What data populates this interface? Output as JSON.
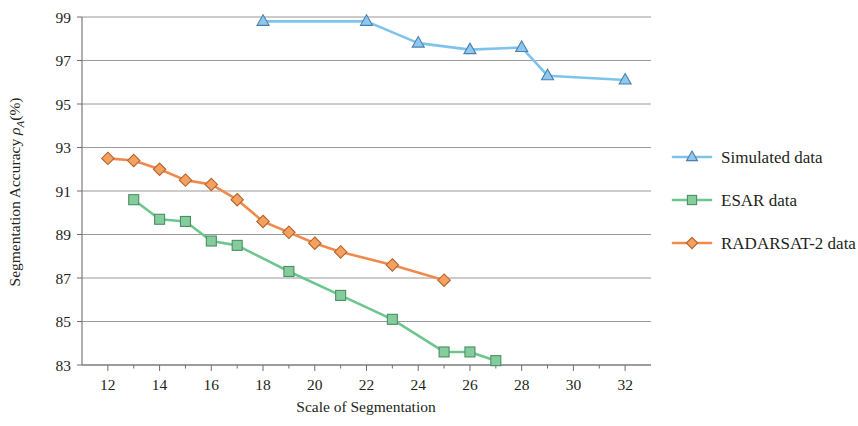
{
  "chart_data": {
    "type": "line",
    "title": "",
    "xlabel": "Scale of Segmentation",
    "ylabel": "Segmentation Accuracy ρA(%)",
    "ylabel_parts": {
      "prefix": "Segmentation Accuracy ",
      "symbol": "ρ",
      "subscript": "A",
      "suffix": "(%)"
    },
    "xlim": [
      11,
      33
    ],
    "ylim": [
      83,
      99
    ],
    "xticks": [
      12,
      14,
      16,
      18,
      20,
      22,
      24,
      26,
      28,
      30,
      32
    ],
    "xticks_minor": [
      13,
      15,
      17,
      19,
      21,
      23,
      25,
      27,
      29,
      31
    ],
    "yticks": [
      83,
      85,
      87,
      89,
      91,
      93,
      95,
      97,
      99
    ],
    "grid": "horizontal",
    "legend_position": "right",
    "series": [
      {
        "name": "Simulated data",
        "color": "#7EC3EC",
        "marker": "triangle",
        "marker_fill": "#8FC8EE",
        "marker_stroke": "#4a7fae",
        "x": [
          18,
          22,
          24,
          26,
          28,
          29,
          32
        ],
        "y": [
          98.8,
          98.8,
          97.8,
          97.5,
          97.6,
          96.3,
          96.1
        ]
      },
      {
        "name": "ESAR data",
        "color": "#6CC68E",
        "marker": "square",
        "marker_fill": "#84CC9B",
        "marker_stroke": "#4a8f63",
        "x": [
          13,
          14,
          15,
          16,
          17,
          19,
          21,
          23,
          25,
          26,
          27
        ],
        "y": [
          90.6,
          89.7,
          89.6,
          88.7,
          88.5,
          87.3,
          86.2,
          85.1,
          83.6,
          83.6,
          83.2
        ]
      },
      {
        "name": "RADARSAT-2 data",
        "color": "#F08A4B",
        "marker": "diamond",
        "marker_fill": "#F4A05F",
        "marker_stroke": "#b4642f",
        "x": [
          12,
          13,
          14,
          15,
          16,
          17,
          18,
          19,
          20,
          21,
          23,
          25
        ],
        "y": [
          92.5,
          92.4,
          92.0,
          91.5,
          91.3,
          90.6,
          89.6,
          89.1,
          88.6,
          88.2,
          87.6,
          86.9
        ]
      }
    ]
  },
  "legend": {
    "entries": [
      {
        "label": "Simulated data"
      },
      {
        "label": "ESAR data"
      },
      {
        "label": "RADARSAT-2 data"
      }
    ]
  }
}
